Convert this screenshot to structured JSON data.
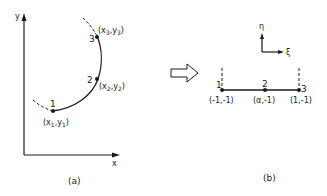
{
  "figure_a": {
    "caption": "(a)",
    "axes": {
      "x_label": "x",
      "y_label": "y"
    },
    "nodes": [
      {
        "id": "1",
        "label": "1",
        "coord": "(x1,y1)"
      },
      {
        "id": "2",
        "label": "2",
        "coord": "(x2,y2)"
      },
      {
        "id": "3",
        "label": "3",
        "coord": "(x3,y3)"
      }
    ]
  },
  "transform_arrow": {
    "icon": "hollow-right-arrow-icon"
  },
  "figure_b": {
    "caption": "(b)",
    "axes": {
      "xi_label": "ξ",
      "eta_label": "η"
    },
    "nodes": [
      {
        "id": "1",
        "label": "1",
        "coord": "(-1,-1)"
      },
      {
        "id": "2",
        "label": "2",
        "coord": "(α,-1)"
      },
      {
        "id": "3",
        "label": "3",
        "coord": "(1,-1)"
      }
    ]
  }
}
